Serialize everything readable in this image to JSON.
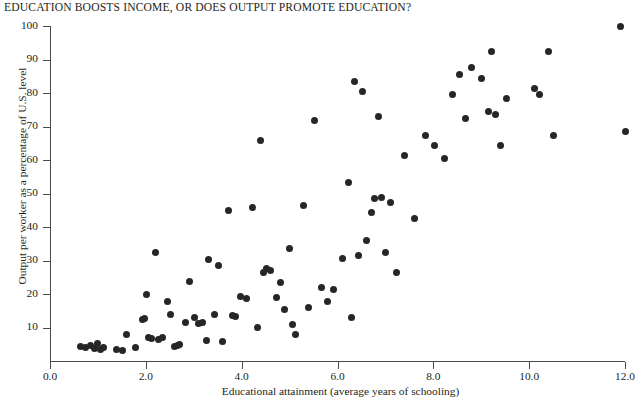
{
  "figure": {
    "title": "EDUCATION BOOSTS INCOME, OR DOES OUTPUT PROMOTE EDUCATION?",
    "marker_color": "#262626",
    "axis_color": "#4a4a4a",
    "background": "#ffffff"
  },
  "chart_data": {
    "type": "scatter",
    "title": "EDUCATION BOOSTS INCOME, OR DOES OUTPUT PROMOTE EDUCATION?",
    "xlabel": "Educational attainment (average years of schooling)",
    "ylabel": "Output per worker as a percentage of U.S. level",
    "xlim": [
      0.0,
      12.0
    ],
    "ylim": [
      0,
      100
    ],
    "xticks": [
      "0.0",
      "2.0",
      "4.0",
      "6.0",
      "8.0",
      "10.0",
      "12.0"
    ],
    "xtick_values": [
      0.0,
      2.0,
      4.0,
      6.0,
      8.0,
      10.0,
      12.0
    ],
    "yticks": [
      "10",
      "20",
      "30",
      "40",
      "50",
      "60",
      "70",
      "80",
      "90",
      "100"
    ],
    "ytick_values": [
      10,
      20,
      30,
      40,
      50,
      60,
      70,
      80,
      90,
      100
    ],
    "grid": false,
    "legend": null,
    "marker": "filled-circle",
    "points": [
      [
        0.64,
        4.5
      ],
      [
        0.75,
        4.2
      ],
      [
        0.85,
        4.8
      ],
      [
        0.92,
        4.0
      ],
      [
        1.0,
        5.5
      ],
      [
        1.05,
        3.6
      ],
      [
        1.12,
        4.3
      ],
      [
        1.38,
        3.5
      ],
      [
        1.52,
        3.2
      ],
      [
        1.6,
        8.2
      ],
      [
        1.78,
        4.1
      ],
      [
        1.92,
        12.5
      ],
      [
        1.98,
        12.8
      ],
      [
        2.02,
        20.0
      ],
      [
        2.05,
        7.1
      ],
      [
        2.12,
        6.9
      ],
      [
        2.2,
        32.5
      ],
      [
        2.26,
        6.5
      ],
      [
        2.34,
        7.3
      ],
      [
        2.45,
        17.8
      ],
      [
        2.52,
        14.0
      ],
      [
        2.6,
        4.6
      ],
      [
        2.66,
        4.9
      ],
      [
        2.7,
        5.2
      ],
      [
        2.82,
        11.6
      ],
      [
        2.9,
        23.8
      ],
      [
        3.02,
        13.2
      ],
      [
        3.1,
        11.3
      ],
      [
        3.18,
        11.5
      ],
      [
        3.26,
        6.3
      ],
      [
        3.3,
        30.5
      ],
      [
        3.44,
        13.9
      ],
      [
        3.52,
        28.5
      ],
      [
        3.6,
        6.1
      ],
      [
        3.72,
        45.0
      ],
      [
        3.8,
        13.6
      ],
      [
        3.86,
        13.3
      ],
      [
        3.98,
        19.5
      ],
      [
        4.1,
        18.7
      ],
      [
        4.22,
        45.8
      ],
      [
        4.32,
        10.2
      ],
      [
        4.4,
        66.0
      ],
      [
        4.46,
        26.5
      ],
      [
        4.52,
        27.6
      ],
      [
        4.6,
        27.0
      ],
      [
        4.72,
        19.0
      ],
      [
        4.8,
        23.6
      ],
      [
        4.9,
        15.5
      ],
      [
        5.0,
        33.8
      ],
      [
        5.05,
        11.0
      ],
      [
        5.12,
        8.2
      ],
      [
        5.28,
        46.5
      ],
      [
        5.4,
        16.0
      ],
      [
        5.52,
        71.8
      ],
      [
        5.66,
        22.2
      ],
      [
        5.8,
        17.9
      ],
      [
        5.92,
        21.5
      ],
      [
        6.1,
        30.8
      ],
      [
        6.22,
        53.5
      ],
      [
        6.3,
        13.0
      ],
      [
        6.36,
        83.5
      ],
      [
        6.44,
        31.5
      ],
      [
        6.52,
        80.5
      ],
      [
        6.6,
        36.0
      ],
      [
        6.7,
        44.5
      ],
      [
        6.78,
        48.5
      ],
      [
        6.86,
        73.0
      ],
      [
        6.92,
        49.0
      ],
      [
        7.0,
        32.5
      ],
      [
        7.1,
        47.5
      ],
      [
        7.22,
        26.5
      ],
      [
        7.4,
        61.5
      ],
      [
        7.6,
        42.5
      ],
      [
        7.84,
        67.5
      ],
      [
        8.02,
        64.5
      ],
      [
        8.24,
        60.5
      ],
      [
        8.4,
        79.5
      ],
      [
        8.54,
        85.5
      ],
      [
        8.68,
        72.5
      ],
      [
        8.8,
        87.5
      ],
      [
        9.0,
        84.5
      ],
      [
        9.14,
        74.5
      ],
      [
        9.22,
        92.5
      ],
      [
        9.3,
        73.5
      ],
      [
        9.4,
        64.5
      ],
      [
        9.52,
        78.5
      ],
      [
        10.1,
        81.5
      ],
      [
        10.22,
        79.5
      ],
      [
        10.4,
        92.5
      ],
      [
        10.5,
        67.5
      ],
      [
        11.9,
        100.0
      ],
      [
        12.0,
        68.5
      ]
    ]
  }
}
